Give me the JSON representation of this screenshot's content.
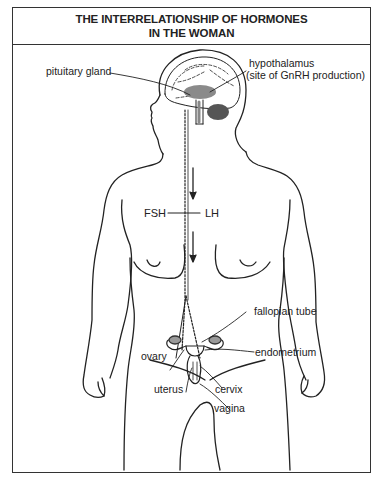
{
  "title": {
    "line1": "THE INTERRELATIONSHIP OF HORMONES",
    "line2": "IN THE WOMAN"
  },
  "labels": {
    "pituitary": "pituitary gland",
    "hypothalamus": "hypothalamus",
    "hypothalamus_note": "(site  of GnRH production)",
    "fsh": "FSH",
    "lh": "LH",
    "fallopian_tube": "fallopian tube",
    "ovary": "ovary",
    "endometrium": "endometrium",
    "uterus": "uterus",
    "cervix": "cervix",
    "vagina": "vagina"
  },
  "colors": {
    "line": "#222222",
    "brain_shade": "#8a8a8a",
    "background": "#ffffff"
  }
}
